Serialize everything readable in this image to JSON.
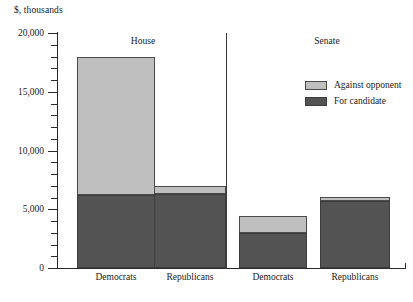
{
  "chart_data": {
    "type": "bar",
    "subtype": "stacked-bar",
    "title": "",
    "xlabel": "",
    "ylabel": "$, thousands",
    "ylim": [
      0,
      20000
    ],
    "ytick_values": [
      0,
      5000,
      10000,
      15000,
      20000
    ],
    "ytick_labels": [
      "0",
      "5,000",
      "10,000",
      "15,000",
      "20,000"
    ],
    "minor_tick_interval": 1000,
    "grid": false,
    "legend_position": "upper right",
    "panels": [
      {
        "name": "House",
        "label": "House"
      },
      {
        "name": "Senate",
        "label": "Senate"
      }
    ],
    "categories": [
      "Democrats",
      "Republicans",
      "Democrats",
      "Republicans"
    ],
    "category_panels": [
      "House",
      "House",
      "Senate",
      "Senate"
    ],
    "series": [
      {
        "name": "For candidate",
        "color": "#535353",
        "values": [
          6200,
          6300,
          2950,
          5700
        ]
      },
      {
        "name": "Against opponent",
        "color": "#bfbfbf",
        "values": [
          11800,
          700,
          1450,
          350
        ]
      }
    ],
    "totals": [
      18000,
      7000,
      4400,
      6050
    ],
    "legend": [
      {
        "label": "Against opponent",
        "color": "#bfbfbf"
      },
      {
        "label": "For candidate",
        "color": "#535353"
      }
    ]
  },
  "axis": {
    "y_title": "$, thousands"
  },
  "bars": [
    {
      "name": "house-democrats",
      "label": "Democrats",
      "for_candidate": 6200,
      "against_opponent": 11800,
      "total": 18000,
      "center_px": 116,
      "left_px": 77,
      "width_px": 78
    },
    {
      "name": "house-republicans",
      "label": "Republicans",
      "for_candidate": 6300,
      "against_opponent": 700,
      "total": 7000,
      "center_px": 190,
      "left_px": 154,
      "width_px": 72
    },
    {
      "name": "senate-democrats",
      "label": "Democrats",
      "for_candidate": 2950,
      "against_opponent": 1450,
      "total": 4400,
      "center_px": 273,
      "left_px": 239,
      "width_px": 68
    },
    {
      "name": "senate-republicans",
      "label": "Republicans",
      "for_candidate": 5700,
      "against_opponent": 350,
      "total": 6050,
      "center_px": 355,
      "left_px": 320,
      "width_px": 70
    }
  ],
  "group_labels": [
    {
      "name": "house",
      "text": "House",
      "x_px": 143,
      "y_px": 36
    },
    {
      "name": "senate",
      "text": "Senate",
      "x_px": 327,
      "y_px": 36
    }
  ]
}
